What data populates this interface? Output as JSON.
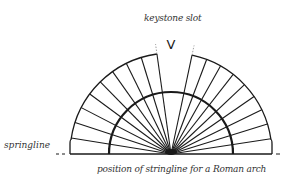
{
  "diagram": {
    "labels": {
      "keystone": "keystone slot",
      "springline": "springline",
      "stringline": "position of stringline for a Roman arch"
    },
    "keystone_marker": "V",
    "geometry": {
      "center": [
        171,
        154
      ],
      "outer_radius": 101,
      "inner_radius": 62,
      "baseline_y": 154,
      "voussoirs_left": 9,
      "voussoirs_right": 9,
      "keystone_gap_deg": [
        78,
        98
      ]
    },
    "colors": {
      "stroke": "#1a1a1a",
      "text": "#333333",
      "background": "#ffffff"
    }
  }
}
